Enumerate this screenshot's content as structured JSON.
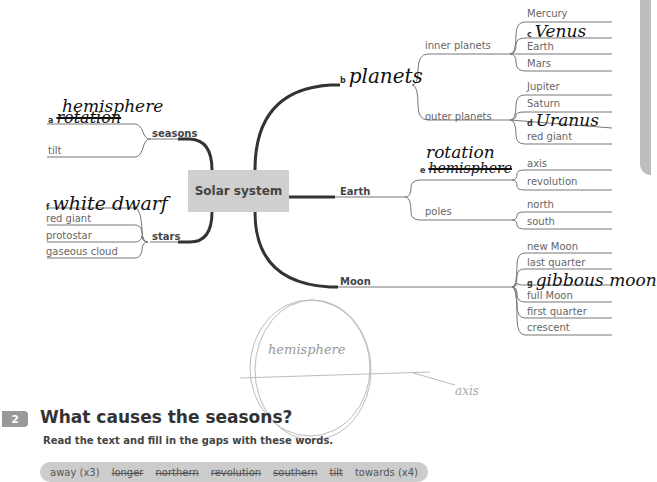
{
  "mindmap": {
    "center": "Solar system",
    "branches": {
      "seasons": {
        "label": "seasons",
        "items": [
          {
            "letter": "a",
            "handwritten": "hemisphere",
            "crossed_out": "rotation"
          },
          {
            "label": "tilt"
          }
        ]
      },
      "stars": {
        "label": "stars",
        "items": [
          {
            "letter": "f",
            "handwritten": "white dwarf"
          },
          {
            "label": "red giant"
          },
          {
            "label": "protostar"
          },
          {
            "label": "gaseous cloud"
          }
        ]
      },
      "planets": {
        "letter": "b",
        "handwritten": "planets",
        "inner": {
          "label": "inner planets",
          "items": [
            "Mercury",
            "Venus",
            "Earth",
            "Mars"
          ],
          "gap_letter": "c"
        },
        "outer": {
          "label": "outer planets",
          "items": [
            "Jupiter",
            "Saturn",
            "Uranus",
            "red giant"
          ],
          "gap_letter": "d"
        }
      },
      "earth": {
        "label": "Earth",
        "motion": {
          "letter": "e",
          "handwritten": "rotation",
          "crossed_out": "hemisphere",
          "items": [
            "axis",
            "revolution"
          ]
        },
        "poles": {
          "label": "poles",
          "items": [
            "north",
            "south"
          ]
        }
      },
      "moon": {
        "label": "Moon",
        "items": [
          "new Moon",
          "last quarter",
          "gibbous moon",
          "full Moon",
          "first quarter",
          "crescent"
        ],
        "gap_letter": "g"
      }
    }
  },
  "sketch": {
    "hemisphere_label": "hemisphere",
    "axis_label": "axis"
  },
  "exercise": {
    "number": "2",
    "title": "What causes the seasons?",
    "instruction": "Read the text and fill in the gaps with these words.",
    "word_bank": [
      {
        "word": "away (x3)",
        "crossed": false
      },
      {
        "word": "longer",
        "crossed": true
      },
      {
        "word": "northern",
        "crossed": true
      },
      {
        "word": "revolution",
        "crossed": true
      },
      {
        "word": "southern",
        "crossed": true
      },
      {
        "word": "tilt",
        "crossed": true
      },
      {
        "word": "towards (x4)",
        "crossed": false
      }
    ]
  }
}
